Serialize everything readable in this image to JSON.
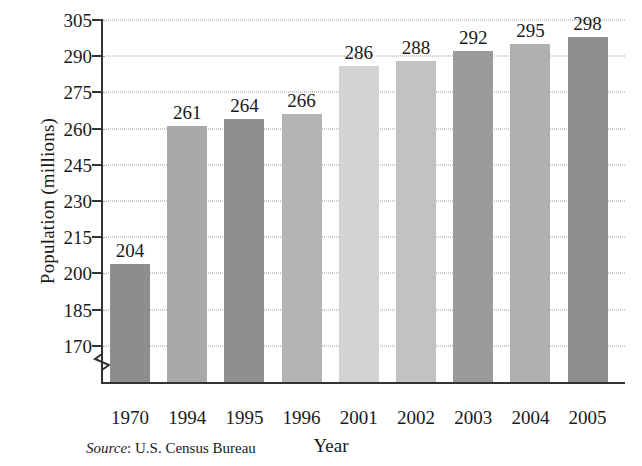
{
  "chart_data": {
    "type": "bar",
    "title": "",
    "xlabel": "Year",
    "ylabel": "Population (millions)",
    "categories": [
      "1970",
      "1994",
      "1995",
      "1996",
      "2001",
      "2002",
      "2003",
      "2004",
      "2005"
    ],
    "values": [
      204,
      261,
      264,
      266,
      286,
      288,
      292,
      295,
      298
    ],
    "value_labels": [
      "204",
      "261",
      "264",
      "266",
      "286",
      "288",
      "292",
      "295",
      "298"
    ],
    "ylim": [
      155,
      305
    ],
    "y_ticks": [
      170,
      185,
      200,
      215,
      230,
      245,
      260,
      275,
      290,
      305
    ],
    "y_tick_labels": [
      "170",
      "185",
      "200",
      "215",
      "230",
      "245",
      "260",
      "275",
      "290",
      "305"
    ],
    "axis_break": true,
    "axis_break_note": "y-axis broken below 170",
    "grid": true,
    "grid_style": "dotted",
    "legend": "none",
    "bar_colors": [
      "#8d8d8d",
      "#a9a9a9",
      "#8f8f8f",
      "#b4b4b4",
      "#d3d3d3",
      "#c2c2c2",
      "#9b9b9b",
      "#b0b0b0",
      "#8e8e8e"
    ]
  },
  "source": {
    "label": "Source",
    "text": ": U.S. Census Bureau"
  },
  "axis_colors": {
    "axis_line": "#333333",
    "gridline": "#9a9a9a",
    "text": "#1a1a1a"
  }
}
